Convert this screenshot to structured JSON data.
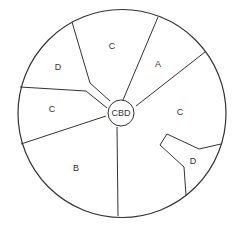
{
  "diagram": {
    "center_label": "CBD",
    "stroke_color": "#333333",
    "regions": [
      {
        "label": "C",
        "x": 112,
        "y": 47
      },
      {
        "label": "A",
        "x": 158,
        "y": 65
      },
      {
        "label": "D",
        "x": 58,
        "y": 68
      },
      {
        "label": "C",
        "x": 52,
        "y": 110
      },
      {
        "label": "C",
        "x": 180,
        "y": 113
      },
      {
        "label": "B",
        "x": 76,
        "y": 169
      },
      {
        "label": "D",
        "x": 193,
        "y": 162
      }
    ]
  }
}
